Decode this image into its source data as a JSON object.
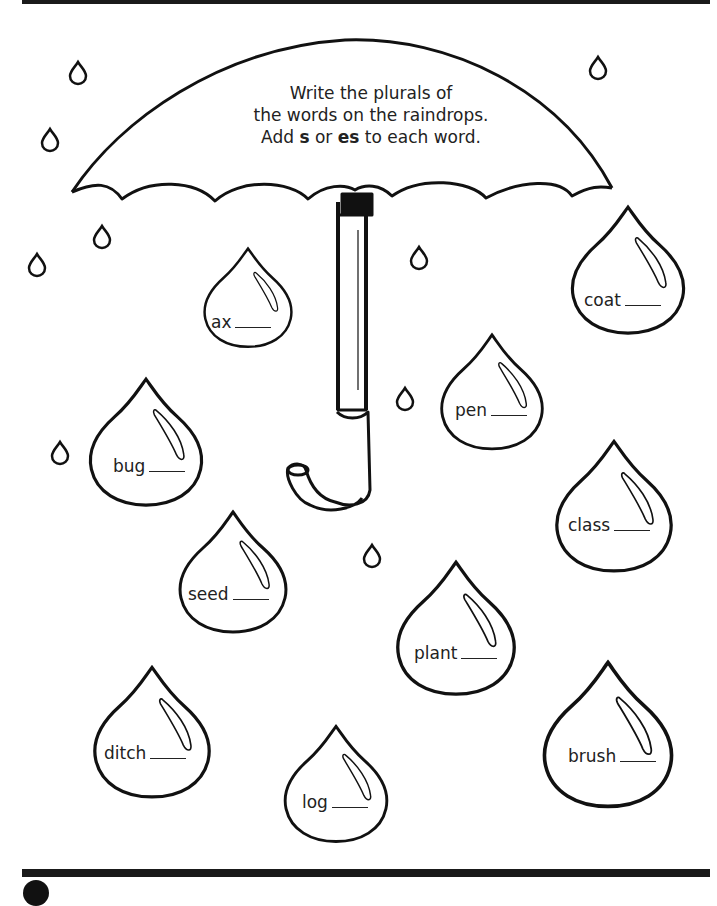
{
  "worksheet": {
    "instructions": {
      "line1": "Write the plurals of",
      "line2": "the words on the raindrops.",
      "line3_pre": "Add ",
      "line3_s": "s",
      "line3_mid": " or ",
      "line3_es": "es",
      "line3_post": " to each word."
    },
    "raindrops": [
      {
        "word": "ax",
        "answer": ""
      },
      {
        "word": "coat",
        "answer": ""
      },
      {
        "word": "pen",
        "answer": ""
      },
      {
        "word": "bug",
        "answer": ""
      },
      {
        "word": "class",
        "answer": ""
      },
      {
        "word": "seed",
        "answer": ""
      },
      {
        "word": "plant",
        "answer": ""
      },
      {
        "word": "ditch",
        "answer": ""
      },
      {
        "word": "log",
        "answer": ""
      },
      {
        "word": "brush",
        "answer": ""
      }
    ],
    "colors": {
      "ink": "#1a1a1a",
      "paper": "#ffffff"
    }
  }
}
